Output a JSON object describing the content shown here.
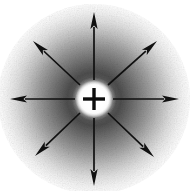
{
  "figure": {
    "type": "physics-field-diagram",
    "width": 190,
    "height": 191,
    "background_color": "#ffffff",
    "texture": "grainy-halftone"
  },
  "charge": {
    "label": "+",
    "sign": "positive",
    "icon": "plus-sign",
    "center_x": 94,
    "center_y": 99,
    "glyph_color": "#0d0d0d",
    "glyph_arm_length": 11,
    "glyph_arm_thickness": 3.4,
    "halo": {
      "inner_white_radius": 9,
      "outer_white_radius": 17,
      "color": "#ffffff"
    }
  },
  "glow": {
    "description": "radial halftone cloud, dark ring around the charge fading to white at the edges",
    "darkest_color": "#4a4a4a",
    "mid_color": "#8e8e8e",
    "edge_color": "#ffffff",
    "dark_ring_inner_radius": 18,
    "dark_ring_outer_radius": 34,
    "fade_radius": 96
  },
  "field_arrows": {
    "count": 8,
    "color": "#101010",
    "shaft_width": 1.7,
    "head_length": 17,
    "head_half_width": 3.6,
    "tail_radius": 19,
    "items": [
      {
        "name": "arrow-north",
        "direction": "up",
        "angle_deg": 270,
        "tail_x": 94,
        "tail_y": 80,
        "tip_x": 94,
        "tip_y": 12
      },
      {
        "name": "arrow-northeast",
        "direction": "up-right",
        "angle_deg": 315,
        "tail_x": 108,
        "tail_y": 85,
        "tip_x": 157,
        "tip_y": 41
      },
      {
        "name": "arrow-east",
        "direction": "right",
        "angle_deg": 0,
        "tail_x": 113,
        "tail_y": 99,
        "tip_x": 179,
        "tip_y": 99
      },
      {
        "name": "arrow-southeast",
        "direction": "down-right",
        "angle_deg": 45,
        "tail_x": 108,
        "tail_y": 113,
        "tip_x": 154,
        "tip_y": 157
      },
      {
        "name": "arrow-south",
        "direction": "down",
        "angle_deg": 90,
        "tail_x": 94,
        "tail_y": 118,
        "tip_x": 94,
        "tip_y": 186
      },
      {
        "name": "arrow-southwest",
        "direction": "down-left",
        "angle_deg": 135,
        "tail_x": 80,
        "tail_y": 113,
        "tip_x": 35,
        "tip_y": 156
      },
      {
        "name": "arrow-west",
        "direction": "left",
        "angle_deg": 180,
        "tail_x": 75,
        "tail_y": 99,
        "tip_x": 10,
        "tip_y": 99
      },
      {
        "name": "arrow-northwest",
        "direction": "up-left",
        "angle_deg": 225,
        "tail_x": 80,
        "tail_y": 85,
        "tip_x": 33,
        "tip_y": 41
      }
    ]
  }
}
